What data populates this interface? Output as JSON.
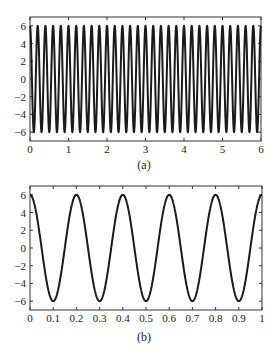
{
  "chart_data": [
    {
      "type": "line",
      "panel": "(a)",
      "title": "",
      "xlabel": "",
      "ylabel": "",
      "caption": "(a)",
      "function": "y = 6*cos(2*pi*5*t)",
      "frequency_hz": 5,
      "amplitude": 6,
      "xlim": [
        0,
        6
      ],
      "ylim": [
        -7,
        7
      ],
      "xticks": [
        0,
        1,
        2,
        3,
        4,
        5,
        6
      ],
      "xtick_labels": [
        "0",
        "1",
        "2",
        "3",
        "4",
        "5",
        "6"
      ],
      "yticks": [
        -6,
        -4,
        -2,
        0,
        2,
        4,
        6
      ],
      "ytick_labels": [
        "-6",
        "-4",
        "-2",
        "0",
        "2",
        "4",
        "6"
      ],
      "grid": false,
      "legend": null,
      "series": [
        {
          "name": "signal",
          "color": "#1a1a1a",
          "cycles": 30
        }
      ]
    },
    {
      "type": "line",
      "panel": "(b)",
      "title": "",
      "xlabel": "",
      "ylabel": "",
      "caption": "(b)",
      "function": "y = 6*cos(2*pi*5*t)",
      "frequency_hz": 5,
      "amplitude": 6,
      "xlim": [
        0,
        1
      ],
      "ylim": [
        -7,
        7
      ],
      "xticks": [
        0,
        0.1,
        0.2,
        0.3,
        0.4,
        0.5,
        0.6,
        0.7,
        0.8,
        0.9,
        1
      ],
      "xtick_labels": [
        "0",
        "0.1",
        "0.2",
        "0.3",
        "0.4",
        "0.5",
        "0.6",
        "0.7",
        "0.8",
        "0.9",
        "1"
      ],
      "yticks": [
        -6,
        -4,
        -2,
        0,
        2,
        4,
        6
      ],
      "ytick_labels": [
        "-6",
        "-4",
        "-2",
        "0",
        "2",
        "4",
        "6"
      ],
      "grid": false,
      "legend": null,
      "series": [
        {
          "name": "signal",
          "color": "#1a1a1a",
          "cycles": 5
        }
      ]
    }
  ],
  "captions": {
    "a": "(a)",
    "b": "(b)"
  }
}
